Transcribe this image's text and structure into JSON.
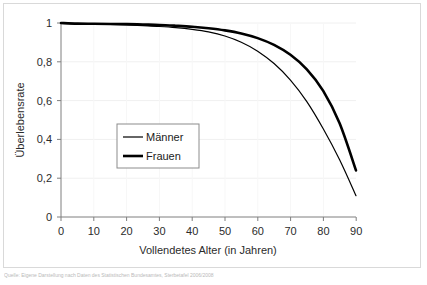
{
  "chart_data": {
    "type": "line",
    "title": "",
    "subtitle": "",
    "xlabel": "Vollendetes Alter (in Jahren)",
    "ylabel": "Überlebensrate",
    "xlim": [
      0,
      90
    ],
    "ylim": [
      0,
      1
    ],
    "xticks": [
      0,
      10,
      20,
      30,
      40,
      50,
      60,
      70,
      80,
      90
    ],
    "xtick_labels": [
      "0",
      "10",
      "20",
      "30",
      "40",
      "50",
      "60",
      "70",
      "80",
      "90"
    ],
    "yticks": [
      0,
      0.2,
      0.4,
      0.6,
      0.8,
      1
    ],
    "ytick_labels": [
      "0",
      "0,2",
      "0,4",
      "0,6",
      "0,8",
      "1"
    ],
    "grid": "horizontal-faint",
    "legend_position": "center-left-inside",
    "background": "#ffffff",
    "axis_color": "#808080",
    "line_color": "#000000",
    "x": [
      0,
      5,
      10,
      15,
      20,
      25,
      30,
      35,
      40,
      45,
      50,
      55,
      60,
      65,
      70,
      75,
      80,
      85,
      90
    ],
    "series": [
      {
        "name": "Männer",
        "style": "thin",
        "line_width": 1.2,
        "color": "#000000",
        "values": [
          1.0,
          0.996,
          0.995,
          0.993,
          0.99,
          0.986,
          0.982,
          0.976,
          0.967,
          0.954,
          0.933,
          0.901,
          0.855,
          0.791,
          0.706,
          0.595,
          0.455,
          0.295,
          0.11
        ]
      },
      {
        "name": "Frauen",
        "style": "thick",
        "line_width": 2.6,
        "color": "#000000",
        "values": [
          1.0,
          0.997,
          0.996,
          0.995,
          0.994,
          0.992,
          0.99,
          0.986,
          0.981,
          0.973,
          0.962,
          0.946,
          0.922,
          0.887,
          0.836,
          0.761,
          0.65,
          0.483,
          0.24
        ]
      }
    ]
  },
  "legend": {
    "items": [
      {
        "label": "Männer",
        "style": "thin"
      },
      {
        "label": "Frauen",
        "style": "thick"
      }
    ]
  },
  "caption": {
    "text": "Quelle: Eigene Darstellung nach Daten des Statistischen Bundesamtes, Sterbetafel 2006/2008"
  }
}
